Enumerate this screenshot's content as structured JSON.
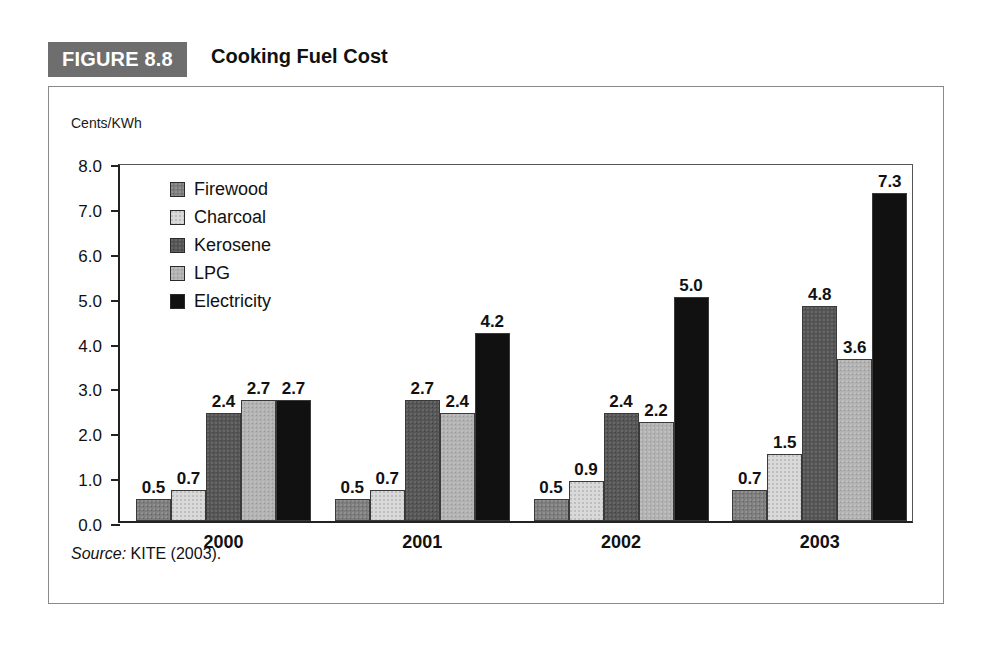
{
  "figure": {
    "number_label": "FIGURE 8.8",
    "title": "Cooking Fuel Cost",
    "source_prefix": "Source:",
    "source_text": "KITE (2003)."
  },
  "chart_data": {
    "type": "bar",
    "title": "Cooking Fuel Cost",
    "xlabel": "",
    "ylabel": "Cents/KWh",
    "categories": [
      "2000",
      "2001",
      "2002",
      "2003"
    ],
    "series": [
      {
        "name": "Firewood",
        "color": "#7e7e7e",
        "values": [
          0.5,
          0.5,
          0.5,
          0.7
        ]
      },
      {
        "name": "Charcoal",
        "color": "#d9d9d9",
        "values": [
          0.7,
          0.7,
          0.9,
          1.5
        ]
      },
      {
        "name": "Kerosene",
        "color": "#565656",
        "values": [
          2.4,
          2.7,
          2.4,
          4.8
        ]
      },
      {
        "name": "LPG",
        "color": "#b2b2b2",
        "values": [
          2.7,
          2.4,
          2.2,
          3.6
        ]
      },
      {
        "name": "Electricity",
        "color": "#111111",
        "values": [
          2.7,
          4.2,
          5.0,
          7.3
        ]
      }
    ],
    "ylim": [
      0.0,
      8.0
    ],
    "ytick_step": 1.0,
    "ytick_labels": [
      "8.0",
      "7.0",
      "6.0",
      "5.0",
      "4.0",
      "3.0",
      "2.0",
      "1.0",
      "0.0"
    ],
    "data_labels": true,
    "grid": false,
    "legend_position": "inside-top-left"
  },
  "colors": {
    "badge_bg": "#6e6e6e",
    "frame": "#8a8a8a",
    "axis": "#222222",
    "text": "#111111"
  }
}
